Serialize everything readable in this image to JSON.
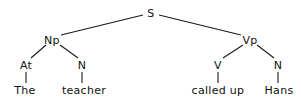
{
  "diagram": {
    "type": "syntax-tree",
    "nodes": {
      "s": {
        "label": "S",
        "x": 151,
        "y": 13
      },
      "np": {
        "label": "Np",
        "x": 52,
        "y": 40
      },
      "vp": {
        "label": "Vp",
        "x": 250,
        "y": 40
      },
      "at": {
        "label": "At",
        "x": 26,
        "y": 65
      },
      "n1": {
        "label": "N",
        "x": 82,
        "y": 65
      },
      "v": {
        "label": "V",
        "x": 218,
        "y": 65
      },
      "n2": {
        "label": "N",
        "x": 278,
        "y": 65
      },
      "the": {
        "label": "The",
        "x": 25,
        "y": 90
      },
      "teacher": {
        "label": "teacher",
        "x": 84,
        "y": 90
      },
      "calledup": {
        "label": "called up",
        "x": 218,
        "y": 90
      },
      "hans": {
        "label": "Hans",
        "x": 279,
        "y": 90
      }
    },
    "edges": [
      [
        "s",
        "np"
      ],
      [
        "s",
        "vp"
      ],
      [
        "np",
        "at"
      ],
      [
        "np",
        "n1"
      ],
      [
        "vp",
        "v"
      ],
      [
        "vp",
        "n2"
      ],
      [
        "at",
        "the"
      ],
      [
        "n1",
        "teacher"
      ],
      [
        "v",
        "calledup"
      ],
      [
        "n2",
        "hans"
      ]
    ]
  }
}
